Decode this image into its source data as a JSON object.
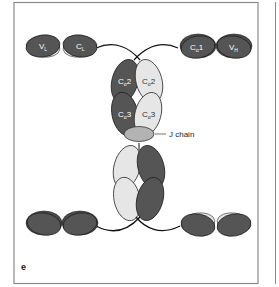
{
  "panel": {
    "letter": "e",
    "frame_color": "#8a8a8a",
    "background": "#ffffff"
  },
  "colors": {
    "heavy_dark": "#555555",
    "light_chain": "#e6e6e6",
    "j_chain": "#b3b3b3",
    "outline": "#222222"
  },
  "labels": {
    "vl": {
      "main": "V",
      "sub": "L"
    },
    "cl": {
      "main": "C",
      "sub": "L"
    },
    "ch1": {
      "main": "C",
      "sub": "α",
      "suffix": "1"
    },
    "vh": {
      "main": "V",
      "sub": "H"
    },
    "ca2_left": {
      "main": "C",
      "sub": "α",
      "suffix": "2"
    },
    "ca2_right": {
      "main": "C",
      "sub": "α",
      "suffix": "2"
    },
    "ca3_left": {
      "main": "C",
      "sub": "α",
      "suffix": "3"
    },
    "ca3_right": {
      "main": "C",
      "sub": "α",
      "suffix": "3"
    },
    "j_chain": "J chain"
  }
}
